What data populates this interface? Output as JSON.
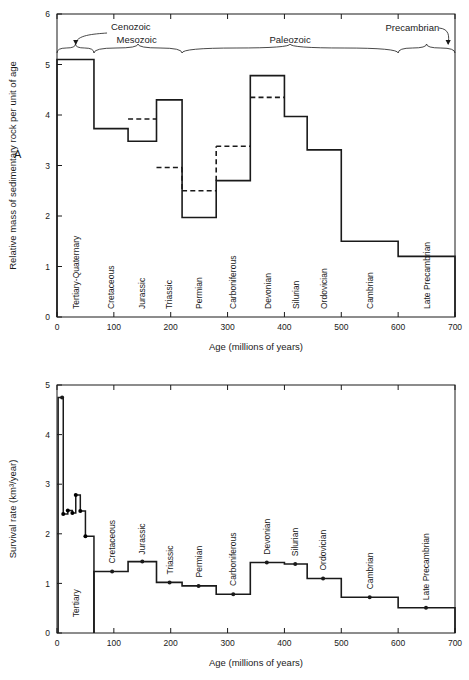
{
  "figure": {
    "panel_a_letter": "A",
    "panel_b_letter": "B"
  },
  "chart_data": [
    {
      "id": "panel-a",
      "type": "bar",
      "title": "",
      "xlabel": "Age (millions of years)",
      "ylabel": "Relative mass of sedimentary rock per unit of age",
      "xlim": [
        0,
        700
      ],
      "ylim": [
        0,
        6
      ],
      "xticks": [
        0,
        100,
        200,
        300,
        400,
        500,
        600,
        700
      ],
      "xtick_labels": [
        "0",
        "100",
        "200",
        "300",
        "400",
        "500",
        "600",
        "700"
      ],
      "yticks": [
        0,
        1,
        2,
        3,
        4,
        5,
        6
      ],
      "ytick_labels": [
        "0",
        "1",
        "2",
        "3",
        "4",
        "5",
        "6"
      ],
      "grid": false,
      "legend": "none",
      "categories": [
        "Tertiary-Quaternary",
        "Cretaceous",
        "Jurassic",
        "Triassic",
        "Permian",
        "Carboniferous",
        "Devonian",
        "Silurian",
        "Ordovician",
        "Cambrian",
        "Late Precambrian"
      ],
      "bin_edges": [
        0,
        65,
        125,
        175,
        220,
        280,
        340,
        400,
        440,
        500,
        600,
        700
      ],
      "values": [
        5.1,
        3.73,
        3.48,
        4.3,
        1.97,
        2.7,
        4.78,
        3.97,
        3.31,
        1.5,
        1.2
      ],
      "dashed_values": [
        null,
        null,
        3.92,
        2.96,
        2.5,
        3.38,
        4.35,
        null,
        null,
        null,
        null
      ],
      "era_brackets": [
        {
          "label": "Cenozoic",
          "start": 0,
          "end": 65,
          "leader": true
        },
        {
          "label": "Mesozoic",
          "start": 65,
          "end": 220,
          "leader": false
        },
        {
          "label": "Paleozoic",
          "start": 220,
          "end": 600,
          "leader": false
        },
        {
          "label": "Precambrian",
          "start": 600,
          "end": 700,
          "leader": true
        }
      ]
    },
    {
      "id": "panel-b",
      "type": "bar",
      "title": "",
      "xlabel": "Age (millions of years)",
      "ylabel": "Survival rate (km³/year)",
      "xlim": [
        0,
        700
      ],
      "ylim": [
        0,
        5
      ],
      "xticks": [
        0,
        100,
        200,
        300,
        400,
        500,
        600,
        700
      ],
      "xtick_labels": [
        "0",
        "100",
        "200",
        "300",
        "400",
        "500",
        "600",
        "700"
      ],
      "yticks": [
        0,
        1,
        2,
        3,
        4,
        5
      ],
      "ytick_labels": [
        "0",
        "1",
        "2",
        "3",
        "4",
        "5"
      ],
      "grid": false,
      "legend": "none",
      "categories": [
        "Tertiary",
        "Cretaceous",
        "Jurassic",
        "Triassic",
        "Permian",
        "Carboniferous",
        "Devonian",
        "Silurian",
        "Ordovician",
        "Cambrian",
        "Late Precambrian"
      ],
      "bin_edges": [
        0,
        65,
        125,
        175,
        220,
        280,
        340,
        400,
        440,
        500,
        600,
        700
      ],
      "values": [
        null,
        1.24,
        1.44,
        1.02,
        0.95,
        0.78,
        1.42,
        1.39,
        1.1,
        0.72,
        0.51
      ],
      "markers": [
        {
          "x": 9,
          "y": 4.75
        },
        {
          "x": 97,
          "y": 1.24
        },
        {
          "x": 150,
          "y": 1.44
        },
        {
          "x": 198,
          "y": 1.02
        },
        {
          "x": 249,
          "y": 0.95
        },
        {
          "x": 310,
          "y": 0.78
        },
        {
          "x": 369,
          "y": 1.42
        },
        {
          "x": 419,
          "y": 1.39
        },
        {
          "x": 468,
          "y": 1.1
        },
        {
          "x": 550,
          "y": 0.72
        },
        {
          "x": 649,
          "y": 0.51
        }
      ],
      "tertiary_curve": [
        {
          "x": 2,
          "y": 0
        },
        {
          "x": 2,
          "y": 4.75
        },
        {
          "x": 11,
          "y": 4.75
        },
        {
          "x": 11,
          "y": 2.4
        },
        {
          "x": 19,
          "y": 2.4
        },
        {
          "x": 19,
          "y": 2.47
        },
        {
          "x": 27,
          "y": 2.47
        },
        {
          "x": 27,
          "y": 2.42
        },
        {
          "x": 33,
          "y": 2.42
        },
        {
          "x": 33,
          "y": 2.78
        },
        {
          "x": 41,
          "y": 2.78
        },
        {
          "x": 41,
          "y": 2.46
        },
        {
          "x": 50,
          "y": 2.46
        },
        {
          "x": 50,
          "y": 1.95
        },
        {
          "x": 65,
          "y": 1.95
        },
        {
          "x": 65,
          "y": 0
        }
      ],
      "tertiary_curve_dots": [
        {
          "x": 11,
          "y": 2.4
        },
        {
          "x": 19,
          "y": 2.47
        },
        {
          "x": 27,
          "y": 2.42
        },
        {
          "x": 33,
          "y": 2.78
        },
        {
          "x": 41,
          "y": 2.46
        },
        {
          "x": 50,
          "y": 1.95
        }
      ]
    }
  ]
}
